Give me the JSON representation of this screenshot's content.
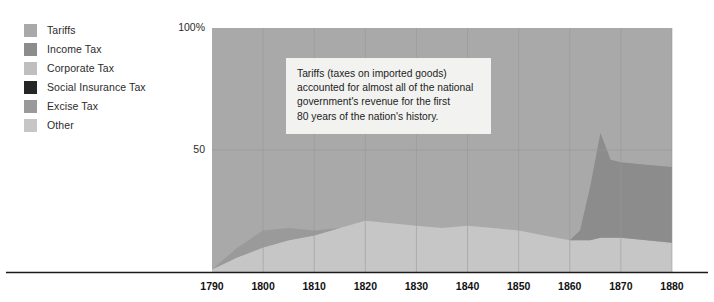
{
  "legend": {
    "items": [
      {
        "label": "Tariffs",
        "color": "#a9a9a9",
        "key": "tariffs"
      },
      {
        "label": "Income Tax",
        "color": "#8c8c8c",
        "key": "income-tax"
      },
      {
        "label": "Corporate Tax",
        "color": "#bfbfbf",
        "key": "corporate-tax"
      },
      {
        "label": "Social Insurance Tax",
        "color": "#262626",
        "key": "social-insurance-tax"
      },
      {
        "label": "Excise Tax",
        "color": "#9a9a9a",
        "key": "excise-tax"
      },
      {
        "label": "Other",
        "color": "#c6c6c6",
        "key": "other"
      }
    ]
  },
  "axes": {
    "y_ticks": [
      {
        "value": 100,
        "label": "100%"
      },
      {
        "value": 50,
        "label": "50"
      }
    ],
    "x_ticks": [
      "1790",
      "1800",
      "1810",
      "1820",
      "1830",
      "1840",
      "1850",
      "1860",
      "1870",
      "1880"
    ]
  },
  "annotation": {
    "lines": [
      "Tariffs (taxes on imported goods)",
      "accounted for almost all of the national",
      "government's revenue for the first",
      "80 years of the nation's history."
    ],
    "background": "#f2f2f0"
  },
  "chart_data": {
    "type": "area",
    "title": "",
    "xlabel": "",
    "ylabel": "",
    "stacked": true,
    "grid": true,
    "legend_position": "left",
    "xlim": [
      1790,
      1880
    ],
    "ylim": [
      0,
      100
    ],
    "x": [
      1790,
      1795,
      1800,
      1805,
      1810,
      1815,
      1820,
      1825,
      1830,
      1835,
      1840,
      1845,
      1850,
      1855,
      1860,
      1862,
      1864,
      1866,
      1868,
      1870,
      1875,
      1880
    ],
    "series": [
      {
        "name": "Other",
        "color": "#c6c6c6",
        "values": [
          1,
          6,
          10,
          13,
          15,
          18,
          21,
          20,
          19,
          18,
          19,
          18,
          17,
          15,
          13,
          13,
          13,
          14,
          14,
          14,
          13,
          12
        ]
      },
      {
        "name": "Excise Tax",
        "color": "#9a9a9a",
        "values": [
          0,
          4,
          7,
          5,
          2,
          0,
          0,
          0,
          0,
          0,
          0,
          0,
          0,
          0,
          0,
          0,
          0,
          0,
          0,
          0,
          0,
          0
        ]
      },
      {
        "name": "Income Tax",
        "color": "#8c8c8c",
        "values": [
          0,
          0,
          0,
          0,
          0,
          0,
          0,
          0,
          0,
          0,
          0,
          0,
          0,
          0,
          0,
          4,
          22,
          43,
          32,
          31,
          31,
          31
        ]
      },
      {
        "name": "Tariffs",
        "color": "#a9a9a9",
        "values": [
          99,
          90,
          83,
          82,
          83,
          82,
          79,
          80,
          81,
          82,
          81,
          82,
          83,
          85,
          87,
          83,
          65,
          43,
          54,
          55,
          56,
          57
        ]
      }
    ],
    "annotations": [
      {
        "text": "Tariffs (taxes on imported goods) accounted for almost all of the national government's revenue for the first 80 years of the nation's history.",
        "x": 1810,
        "y": 80
      }
    ]
  },
  "colors": {
    "plot_background": "#a9a9a9",
    "gridline": "#989898",
    "axis_line": "#1a1a1a",
    "text": "#2b2b2b"
  }
}
